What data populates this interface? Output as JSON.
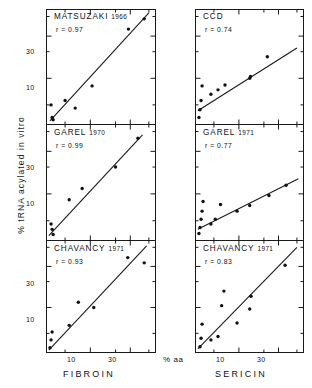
{
  "figure": {
    "axis_y_label": "% tRNA   acylated   in  vitro",
    "axis_x_unit": "% aa",
    "columns": [
      {
        "name": "FIBROIN"
      },
      {
        "name": "SERICIN"
      }
    ],
    "x_ticks": [
      "10",
      "30"
    ],
    "y_ticks": [
      "10",
      "30"
    ]
  },
  "panels": [
    {
      "id": "matsuzaki-fibroin",
      "author": "MATSUZAKI",
      "year": "1966",
      "r_label": "r = 0.97",
      "column": "FIBROIN"
    },
    {
      "id": "ccd-sericin",
      "author": "CCD",
      "year": "",
      "r_label": "r = 0.74",
      "column": "SERICIN"
    },
    {
      "id": "garel-1970-fibroin",
      "author": "GAREL",
      "year": "1970",
      "r_label": "r = 0.99",
      "column": "FIBROIN"
    },
    {
      "id": "garel-1971-sericin",
      "author": "GAREL",
      "year": "1971",
      "r_label": "r = 0.77",
      "column": "SERICIN"
    },
    {
      "id": "chavancy-1971-fibroin",
      "author": "CHAVANCY",
      "year": "1971",
      "r_label": "r = 0.93",
      "column": "FIBROIN"
    },
    {
      "id": "chavancy-1971-sericin",
      "author": "CHAVANCY",
      "year": "1971",
      "r_label": "r = 0.83",
      "column": "SERICIN"
    }
  ],
  "chart_data": {
    "type": "scatter",
    "title": "",
    "xlabel": "% aa",
    "ylabel": "% tRNA acylated in vitro",
    "scale": "log-log",
    "grid": false,
    "legend": "none",
    "xlim": [
      3,
      60
    ],
    "ylim": [
      3,
      60
    ],
    "xtick_values": [
      10,
      30
    ],
    "ytick_values": [
      10,
      30
    ],
    "panels": [
      {
        "name": "MATSUZAKI 1966",
        "column": "FIBROIN",
        "r": 0.97,
        "points": [
          {
            "x": 3.4,
            "y": 5.0
          },
          {
            "x": 3.5,
            "y": 3.6
          },
          {
            "x": 3.6,
            "y": 3.4
          },
          {
            "x": 5.0,
            "y": 5.6
          },
          {
            "x": 6.6,
            "y": 4.6
          },
          {
            "x": 10.5,
            "y": 8.2
          },
          {
            "x": 28.5,
            "y": 36.0
          },
          {
            "x": 44.0,
            "y": 47.0
          }
        ],
        "fit_line": {
          "x1": 3.3,
          "y1": 3.3,
          "x2": 50.0,
          "y2": 55.0
        }
      },
      {
        "name": "CCD",
        "column": "SERICIN",
        "r": 0.74,
        "points": [
          {
            "x": 3.3,
            "y": 3.6
          },
          {
            "x": 3.4,
            "y": 4.4
          },
          {
            "x": 3.5,
            "y": 5.6
          },
          {
            "x": 3.6,
            "y": 8.2
          },
          {
            "x": 4.6,
            "y": 6.6
          },
          {
            "x": 5.6,
            "y": 7.4
          },
          {
            "x": 6.8,
            "y": 8.4
          },
          {
            "x": 13.5,
            "y": 10.0
          },
          {
            "x": 13.8,
            "y": 10.5
          },
          {
            "x": 22.0,
            "y": 17.5
          }
        ],
        "fit_line": {
          "x1": 3.2,
          "y1": 4.3,
          "x2": 50.0,
          "y2": 22.0
        }
      },
      {
        "name": "GAREL 1970",
        "column": "FIBROIN",
        "r": 0.99,
        "points": [
          {
            "x": 3.4,
            "y": 4.6
          },
          {
            "x": 3.5,
            "y": 4.0
          },
          {
            "x": 3.6,
            "y": 3.5
          },
          {
            "x": 5.6,
            "y": 8.6
          },
          {
            "x": 8.0,
            "y": 11.5
          },
          {
            "x": 20.0,
            "y": 20.0
          },
          {
            "x": 37.0,
            "y": 42.0
          }
        ],
        "fit_line": {
          "x1": 3.2,
          "y1": 3.4,
          "x2": 42.0,
          "y2": 46.0
        }
      },
      {
        "name": "GAREL 1971",
        "column": "SERICIN",
        "r": 0.77,
        "points": [
          {
            "x": 3.3,
            "y": 3.6
          },
          {
            "x": 3.4,
            "y": 4.2
          },
          {
            "x": 3.5,
            "y": 5.2
          },
          {
            "x": 3.6,
            "y": 6.4
          },
          {
            "x": 3.7,
            "y": 8.2
          },
          {
            "x": 4.6,
            "y": 4.6
          },
          {
            "x": 5.2,
            "y": 5.2
          },
          {
            "x": 6.0,
            "y": 7.6
          },
          {
            "x": 9.5,
            "y": 6.4
          },
          {
            "x": 13.5,
            "y": 7.4
          },
          {
            "x": 23.0,
            "y": 9.6
          },
          {
            "x": 37.0,
            "y": 12.5
          }
        ],
        "fit_line": {
          "x1": 3.2,
          "y1": 4.0,
          "x2": 52.0,
          "y2": 14.8
        }
      },
      {
        "name": "CHAVANCY 1971",
        "column": "FIBROIN",
        "r": 0.93,
        "points": [
          {
            "x": 3.3,
            "y": 3.4
          },
          {
            "x": 3.4,
            "y": 4.2
          },
          {
            "x": 3.5,
            "y": 5.2
          },
          {
            "x": 5.6,
            "y": 6.2
          },
          {
            "x": 7.2,
            "y": 11.5
          },
          {
            "x": 11.0,
            "y": 10.0
          },
          {
            "x": 28.0,
            "y": 38.0
          },
          {
            "x": 44.0,
            "y": 33.0
          }
        ],
        "fit_line": {
          "x1": 3.2,
          "y1": 3.2,
          "x2": 47.0,
          "y2": 52.0
        }
      },
      {
        "name": "CHAVANCY 1971",
        "column": "SERICIN",
        "r": 0.83,
        "points": [
          {
            "x": 3.4,
            "y": 3.5
          },
          {
            "x": 3.5,
            "y": 4.4
          },
          {
            "x": 3.6,
            "y": 6.4
          },
          {
            "x": 4.6,
            "y": 4.2
          },
          {
            "x": 5.6,
            "y": 4.6
          },
          {
            "x": 6.2,
            "y": 10.5
          },
          {
            "x": 6.6,
            "y": 15.5
          },
          {
            "x": 9.5,
            "y": 6.6
          },
          {
            "x": 13.5,
            "y": 9.6
          },
          {
            "x": 14.0,
            "y": 13.5
          },
          {
            "x": 36.0,
            "y": 31.0
          }
        ],
        "fit_line": {
          "x1": 3.2,
          "y1": 3.3,
          "x2": 50.0,
          "y2": 50.0
        }
      }
    ]
  }
}
